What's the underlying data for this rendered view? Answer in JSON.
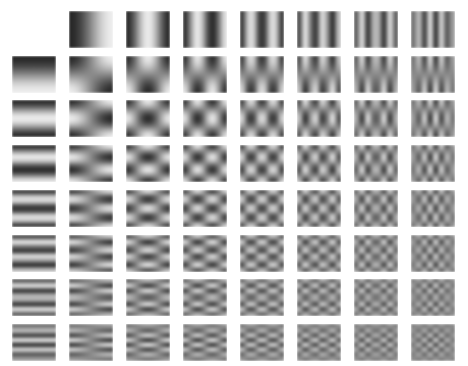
{
  "figure": {
    "kind": "dct-basis-grid",
    "background_color": "#ffffff",
    "width": 468,
    "height": 366
  },
  "chart_data": {
    "type": "heatmap",
    "title": "",
    "subtitle": "",
    "xlabel": "",
    "ylabel": "",
    "legend": [],
    "annotations": [],
    "grid": false,
    "rows": 8,
    "cols": 8,
    "u_indices": [
      0,
      1,
      2,
      3,
      4,
      5,
      6,
      7
    ],
    "v_indices": [
      0,
      1,
      2,
      3,
      4,
      5,
      6,
      7
    ],
    "basis_size": 8,
    "x": [
      0,
      1,
      2,
      3,
      4,
      5,
      6,
      7
    ],
    "y": [
      0,
      1,
      2,
      3,
      4,
      5,
      6,
      7
    ],
    "xlim": [
      0,
      7
    ],
    "ylim": [
      0,
      7
    ],
    "colormap": "gray",
    "value_range": [
      -1,
      1
    ],
    "gray_min": 38,
    "gray_max": 238,
    "gray_mid": 138,
    "blank_cells": [
      [
        0,
        0
      ]
    ],
    "tile": {
      "width": 44,
      "height": 37,
      "col_pitch": 57,
      "row_pitch": 44.7,
      "origin_x": 12,
      "origin_y": 11,
      "smoothing": true,
      "upscale_blur_px": 1.6
    },
    "formula": "B(u,v)[x,y] = cos((2x+1) u pi / 16) * cos((2y+1) v pi / 16)",
    "cells": [
      [
        {
          "row": 0,
          "col": 0,
          "u": 0,
          "v": 0,
          "label": "0,0",
          "blank": true
        },
        {
          "row": 0,
          "col": 1,
          "u": 1,
          "v": 0,
          "label": "1,0",
          "blank": false
        },
        {
          "row": 0,
          "col": 2,
          "u": 2,
          "v": 0,
          "label": "2,0",
          "blank": false
        },
        {
          "row": 0,
          "col": 3,
          "u": 3,
          "v": 0,
          "label": "3,0",
          "blank": false
        },
        {
          "row": 0,
          "col": 4,
          "u": 4,
          "v": 0,
          "label": "4,0",
          "blank": false
        },
        {
          "row": 0,
          "col": 5,
          "u": 5,
          "v": 0,
          "label": "5,0",
          "blank": false
        },
        {
          "row": 0,
          "col": 6,
          "u": 6,
          "v": 0,
          "label": "6,0",
          "blank": false
        },
        {
          "row": 0,
          "col": 7,
          "u": 7,
          "v": 0,
          "label": "7,0",
          "blank": false
        }
      ],
      [
        {
          "row": 1,
          "col": 0,
          "u": 0,
          "v": 1,
          "label": "0,1",
          "blank": false
        },
        {
          "row": 1,
          "col": 1,
          "u": 1,
          "v": 1,
          "label": "1,1",
          "blank": false
        },
        {
          "row": 1,
          "col": 2,
          "u": 2,
          "v": 1,
          "label": "2,1",
          "blank": false
        },
        {
          "row": 1,
          "col": 3,
          "u": 3,
          "v": 1,
          "label": "3,1",
          "blank": false
        },
        {
          "row": 1,
          "col": 4,
          "u": 4,
          "v": 1,
          "label": "4,1",
          "blank": false
        },
        {
          "row": 1,
          "col": 5,
          "u": 5,
          "v": 1,
          "label": "5,1",
          "blank": false
        },
        {
          "row": 1,
          "col": 6,
          "u": 6,
          "v": 1,
          "label": "6,1",
          "blank": false
        },
        {
          "row": 1,
          "col": 7,
          "u": 7,
          "v": 1,
          "label": "7,1",
          "blank": false
        }
      ],
      [
        {
          "row": 2,
          "col": 0,
          "u": 0,
          "v": 2,
          "label": "0,2",
          "blank": false
        },
        {
          "row": 2,
          "col": 1,
          "u": 1,
          "v": 2,
          "label": "1,2",
          "blank": false
        },
        {
          "row": 2,
          "col": 2,
          "u": 2,
          "v": 2,
          "label": "2,2",
          "blank": false
        },
        {
          "row": 2,
          "col": 3,
          "u": 3,
          "v": 2,
          "label": "3,2",
          "blank": false
        },
        {
          "row": 2,
          "col": 4,
          "u": 4,
          "v": 2,
          "label": "4,2",
          "blank": false
        },
        {
          "row": 2,
          "col": 5,
          "u": 5,
          "v": 2,
          "label": "5,2",
          "blank": false
        },
        {
          "row": 2,
          "col": 6,
          "u": 6,
          "v": 2,
          "label": "6,2",
          "blank": false
        },
        {
          "row": 2,
          "col": 7,
          "u": 7,
          "v": 2,
          "label": "7,2",
          "blank": false
        }
      ],
      [
        {
          "row": 3,
          "col": 0,
          "u": 0,
          "v": 3,
          "label": "0,3",
          "blank": false
        },
        {
          "row": 3,
          "col": 1,
          "u": 1,
          "v": 3,
          "label": "1,3",
          "blank": false
        },
        {
          "row": 3,
          "col": 2,
          "u": 2,
          "v": 3,
          "label": "2,3",
          "blank": false
        },
        {
          "row": 3,
          "col": 3,
          "u": 3,
          "v": 3,
          "label": "3,3",
          "blank": false
        },
        {
          "row": 3,
          "col": 4,
          "u": 4,
          "v": 3,
          "label": "4,3",
          "blank": false
        },
        {
          "row": 3,
          "col": 5,
          "u": 5,
          "v": 3,
          "label": "5,3",
          "blank": false
        },
        {
          "row": 3,
          "col": 6,
          "u": 6,
          "v": 3,
          "label": "6,3",
          "blank": false
        },
        {
          "row": 3,
          "col": 7,
          "u": 7,
          "v": 3,
          "label": "7,3",
          "blank": false
        }
      ],
      [
        {
          "row": 4,
          "col": 0,
          "u": 0,
          "v": 4,
          "label": "0,4",
          "blank": false
        },
        {
          "row": 4,
          "col": 1,
          "u": 1,
          "v": 4,
          "label": "1,4",
          "blank": false
        },
        {
          "row": 4,
          "col": 2,
          "u": 2,
          "v": 4,
          "label": "2,4",
          "blank": false
        },
        {
          "row": 4,
          "col": 3,
          "u": 3,
          "v": 4,
          "label": "3,4",
          "blank": false
        },
        {
          "row": 4,
          "col": 4,
          "u": 4,
          "v": 4,
          "label": "4,4",
          "blank": false
        },
        {
          "row": 4,
          "col": 5,
          "u": 5,
          "v": 4,
          "label": "5,4",
          "blank": false
        },
        {
          "row": 4,
          "col": 6,
          "u": 6,
          "v": 4,
          "label": "6,4",
          "blank": false
        },
        {
          "row": 4,
          "col": 7,
          "u": 7,
          "v": 4,
          "label": "7,4",
          "blank": false
        }
      ],
      [
        {
          "row": 5,
          "col": 0,
          "u": 0,
          "v": 5,
          "label": "0,5",
          "blank": false
        },
        {
          "row": 5,
          "col": 1,
          "u": 1,
          "v": 5,
          "label": "1,5",
          "blank": false
        },
        {
          "row": 5,
          "col": 2,
          "u": 2,
          "v": 5,
          "label": "2,5",
          "blank": false
        },
        {
          "row": 5,
          "col": 3,
          "u": 3,
          "v": 5,
          "label": "3,5",
          "blank": false
        },
        {
          "row": 5,
          "col": 4,
          "u": 4,
          "v": 5,
          "label": "4,5",
          "blank": false
        },
        {
          "row": 5,
          "col": 5,
          "u": 5,
          "v": 5,
          "label": "5,5",
          "blank": false
        },
        {
          "row": 5,
          "col": 6,
          "u": 6,
          "v": 5,
          "label": "6,5",
          "blank": false
        },
        {
          "row": 5,
          "col": 7,
          "u": 7,
          "v": 5,
          "label": "7,5",
          "blank": false
        }
      ],
      [
        {
          "row": 6,
          "col": 0,
          "u": 0,
          "v": 6,
          "label": "0,6",
          "blank": false
        },
        {
          "row": 6,
          "col": 1,
          "u": 1,
          "v": 6,
          "label": "1,6",
          "blank": false
        },
        {
          "row": 6,
          "col": 2,
          "u": 2,
          "v": 6,
          "label": "2,6",
          "blank": false
        },
        {
          "row": 6,
          "col": 3,
          "u": 3,
          "v": 6,
          "label": "3,6",
          "blank": false
        },
        {
          "row": 6,
          "col": 4,
          "u": 4,
          "v": 6,
          "label": "4,6",
          "blank": false
        },
        {
          "row": 6,
          "col": 5,
          "u": 5,
          "v": 6,
          "label": "5,6",
          "blank": false
        },
        {
          "row": 6,
          "col": 6,
          "u": 6,
          "v": 6,
          "label": "6,6",
          "blank": false
        },
        {
          "row": 6,
          "col": 7,
          "u": 7,
          "v": 6,
          "label": "7,6",
          "blank": false
        }
      ],
      [
        {
          "row": 7,
          "col": 0,
          "u": 0,
          "v": 7,
          "label": "0,7",
          "blank": false
        },
        {
          "row": 7,
          "col": 1,
          "u": 1,
          "v": 7,
          "label": "1,7",
          "blank": false
        },
        {
          "row": 7,
          "col": 2,
          "u": 2,
          "v": 7,
          "label": "2,7",
          "blank": false
        },
        {
          "row": 7,
          "col": 3,
          "u": 3,
          "v": 7,
          "label": "3,7",
          "blank": false
        },
        {
          "row": 7,
          "col": 4,
          "u": 4,
          "v": 7,
          "label": "4,7",
          "blank": false
        },
        {
          "row": 7,
          "col": 5,
          "u": 5,
          "v": 7,
          "label": "5,7",
          "blank": false
        },
        {
          "row": 7,
          "col": 6,
          "u": 6,
          "v": 7,
          "label": "6,7",
          "blank": false
        },
        {
          "row": 7,
          "col": 7,
          "u": 7,
          "v": 7,
          "label": "7,7",
          "blank": false
        }
      ]
    ]
  }
}
